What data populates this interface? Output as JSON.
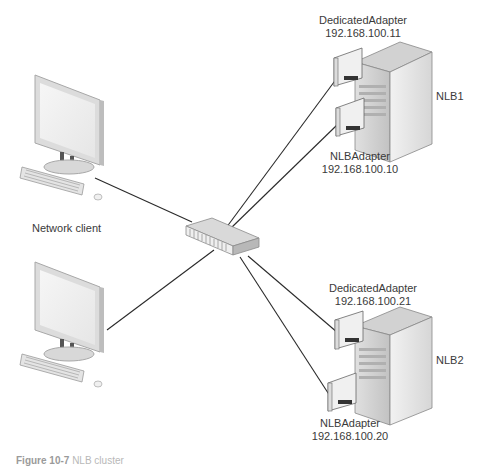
{
  "diagram": {
    "type": "network-topology",
    "clients": {
      "label": "Network client",
      "count": 2
    },
    "switch": {
      "name": "switch"
    },
    "servers": [
      {
        "name": "NLB1",
        "dedicated_adapter": {
          "label": "DedicatedAdapter",
          "ip": "192.168.100.11"
        },
        "nlb_adapter": {
          "label": "NLBAdapter",
          "ip": "192.168.100.10"
        }
      },
      {
        "name": "NLB2",
        "dedicated_adapter": {
          "label": "DedicatedAdapter",
          "ip": "192.168.100.21"
        },
        "nlb_adapter": {
          "label": "NLBAdapter",
          "ip": "192.168.100.20"
        }
      }
    ],
    "caption": {
      "figure": "Figure 10-7",
      "text": "NLB cluster"
    },
    "colors": {
      "line": "#2a2a2a",
      "device_light": "#e8e8e8",
      "device_mid": "#c4c4c4",
      "device_dark": "#8a8a8a",
      "text": "#3a3a3a"
    }
  }
}
